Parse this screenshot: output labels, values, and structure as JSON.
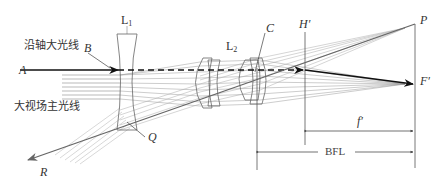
{
  "diagram": {
    "type": "optical-lens-layout",
    "labels": {
      "axial_ray_cn": "沿轴大光线",
      "chief_ray_cn": "大视场主光线",
      "point_A": "A",
      "point_B": "B",
      "point_C": "C",
      "point_Q": "Q",
      "point_R": "R",
      "point_P": "P",
      "focal_point": "F′",
      "principal_plane": "H′",
      "lens1_main": "L",
      "lens1_sub": "1",
      "lens2_main": "L",
      "lens2_sub": "2",
      "focal_length": "f′",
      "back_focal_length": "BFL"
    },
    "colors": {
      "line": "#555555",
      "ray_light": "#9a9a9a",
      "ray_dark": "#222222",
      "chief_ray": "#666666"
    }
  }
}
